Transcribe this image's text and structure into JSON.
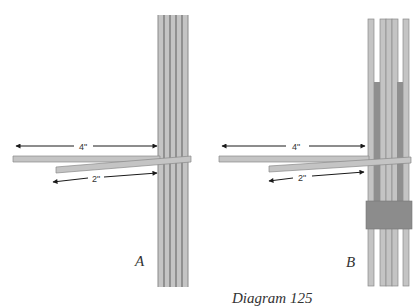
{
  "caption": "Diagram 125",
  "panels": [
    {
      "id": "A",
      "label": "A",
      "long_measure": "4\"",
      "short_measure": "2\"",
      "description": "Two horizontal strips inserted through a bundle of five vertical strips"
    },
    {
      "id": "B",
      "label": "B",
      "long_measure": "4\"",
      "short_measure": "2\"",
      "description": "Horizontal strips woven through spread vertical strips with a wrapping band below"
    }
  ],
  "colors": {
    "strip_fill": "#c4c4c4",
    "strip_edge": "#8a8a8a",
    "dark_strip": "#8f8f8f",
    "band": "#8c8c8c",
    "arrow": "#1a1a1a",
    "text": "#333333"
  }
}
